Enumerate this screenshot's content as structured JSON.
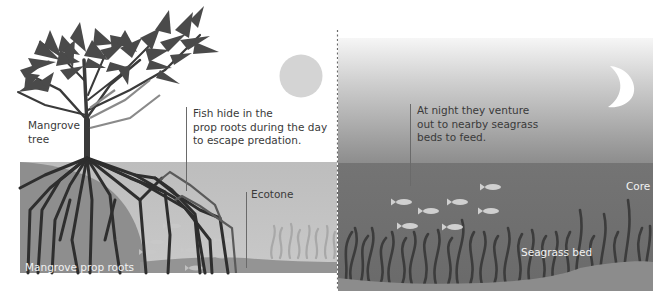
{
  "diagram": {
    "panels": [
      {
        "id": "day",
        "theme": "day",
        "sky_color": "#ffffff",
        "sun_color": "#d4d4d4"
      },
      {
        "id": "night",
        "theme": "night",
        "sky_top": "#f4f4f4",
        "sky_bottom": "#8a8a8a",
        "moon_color": "#ffffff"
      }
    ],
    "labels": {
      "mangrove_tree": [
        "Mangrove",
        "tree"
      ],
      "day_callout": [
        "Fish hide in the",
        "prop roots during the day",
        "to escape predation."
      ],
      "ecotone": "Ecotone",
      "prop_roots": "Mangrove prop roots",
      "night_callout": [
        "At night they venture",
        "out to nearby seagrass",
        "beds to feed."
      ],
      "core": "Core",
      "seagrass_bed": "Seagrass bed"
    },
    "colors": {
      "water_day": "#b9b9b9",
      "bank": "#8e8e8e",
      "water_night": "#6f6f6f",
      "sea_floor": "#8c8c8c",
      "roots": "#2e2e2e",
      "leaves": "#4a4a4a",
      "seagrass": "#3c3c3c",
      "fish": "#cfcfcf",
      "divider": "#6a6a6a"
    },
    "fish_count_night": 7,
    "fish_count_day": 6
  }
}
